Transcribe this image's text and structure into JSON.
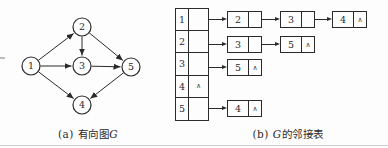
{
  "captions": {
    "a": {
      "pre": "(a) 有向图",
      "em": "G",
      "post": ""
    },
    "b": {
      "pre": "(b) ",
      "em": "G",
      "post": "的邻接表"
    }
  },
  "graph": {
    "type": "directed-graph",
    "node_radius": 9,
    "nodes": [
      {
        "id": "1",
        "x": 31,
        "y": 66
      },
      {
        "id": "2",
        "x": 82,
        "y": 27
      },
      {
        "id": "3",
        "x": 82,
        "y": 66
      },
      {
        "id": "4",
        "x": 82,
        "y": 105
      },
      {
        "id": "5",
        "x": 131,
        "y": 67
      }
    ],
    "edges": [
      {
        "from": "1",
        "to": "2"
      },
      {
        "from": "1",
        "to": "3"
      },
      {
        "from": "1",
        "to": "4"
      },
      {
        "from": "2",
        "to": "3"
      },
      {
        "from": "2",
        "to": "5"
      },
      {
        "from": "3",
        "to": "5"
      },
      {
        "from": "5",
        "to": "4"
      }
    ]
  },
  "adjacency_list": {
    "null_symbol": "∧",
    "rows": [
      {
        "vertex": "1",
        "chain": [
          "2",
          "3",
          "4"
        ]
      },
      {
        "vertex": "2",
        "chain": [
          "3",
          "5"
        ]
      },
      {
        "vertex": "3",
        "chain": [
          "5"
        ]
      },
      {
        "vertex": "4",
        "chain": []
      },
      {
        "vertex": "5",
        "chain": [
          "4"
        ]
      }
    ]
  },
  "colors": {
    "ink": "#2b2b2b",
    "paper": "#fdfdfd",
    "faint_rule": "#cfcfcf"
  }
}
